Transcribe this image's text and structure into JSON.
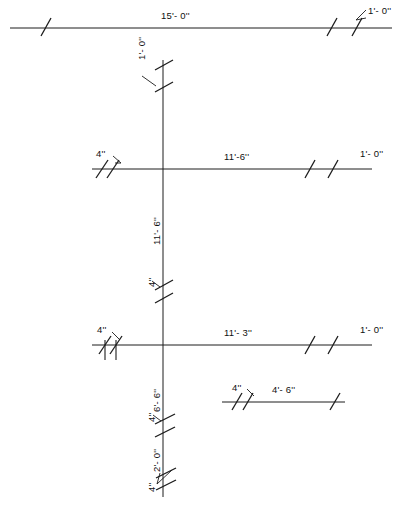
{
  "drawing": {
    "title": "architectural-dimension-plan",
    "line_color": "#1c1c1c",
    "background": "#ffffff",
    "horizontal_dimensions": [
      {
        "id": "top-run",
        "label": "15'- 0''",
        "end_label": "1'- 0''",
        "y": 28,
        "x_start": 10,
        "x_end": 392
      },
      {
        "id": "middle-run",
        "label": "11'-6''",
        "start_label": "4''",
        "end_label": "1'- 0''",
        "y": 169,
        "x_start": 92,
        "x_end": 372
      },
      {
        "id": "lower-run",
        "label": "11'- 3''",
        "start_label": "4''",
        "end_label": "1'- 0''",
        "y": 345,
        "x_start": 92,
        "x_end": 372
      },
      {
        "id": "short-run",
        "label": "4'- 6''",
        "start_label": "4''",
        "y": 402,
        "x_start": 222,
        "x_end": 345
      }
    ],
    "vertical_dimensions": [
      {
        "id": "v-top",
        "label": "1'- 0''"
      },
      {
        "id": "v-mid",
        "label": "11'- 6''"
      },
      {
        "id": "v-mid-tick",
        "label": "4''"
      },
      {
        "id": "v-lower-a",
        "label": "6'- 6''"
      },
      {
        "id": "v-lower-a-tick",
        "label": "4''"
      },
      {
        "id": "v-lower-b",
        "label": "2'- 0''"
      },
      {
        "id": "v-lower-b-tick",
        "label": "4''"
      }
    ],
    "vertical_line": {
      "x": 163,
      "y_start": 60,
      "y_end": 497
    }
  }
}
